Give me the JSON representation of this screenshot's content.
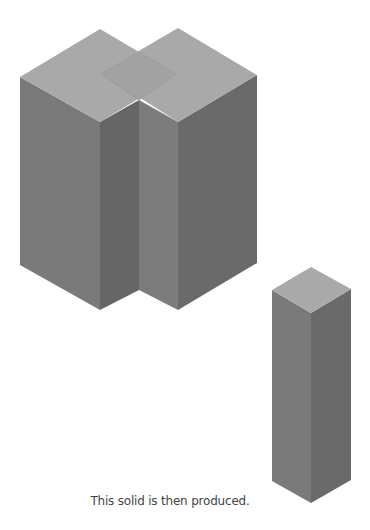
{
  "caption": "This solid is then produced.",
  "colors": {
    "top": "#a9a9a9",
    "overlap": "#a1a1a1",
    "left_face": "#7a7a7a",
    "right_face": "#6a6a6a",
    "notch_left": "#7c7c7c"
  },
  "solids": [
    {
      "name": "combined-solid",
      "description": "Two overlapping square prisms"
    },
    {
      "name": "produced-solid",
      "description": "Single tall square prism"
    }
  ]
}
